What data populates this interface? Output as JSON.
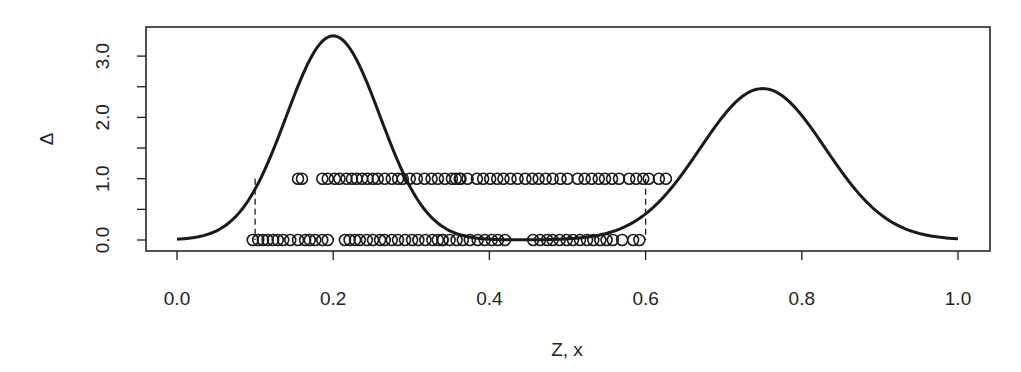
{
  "chart_data": {
    "type": "line",
    "title": "",
    "xlabel": "Z, x",
    "ylabel": "Δ",
    "xlim": [
      0.0,
      1.0
    ],
    "ylim": [
      0.0,
      3.0
    ],
    "x_ticks": [
      0.0,
      0.2,
      0.4,
      0.6,
      0.8,
      1.0
    ],
    "x_tick_labels": [
      "0.0",
      "0.2",
      "0.4",
      "0.6",
      "0.8",
      "1.0"
    ],
    "y_ticks": [
      0.0,
      0.5,
      1.0,
      1.5,
      2.0,
      2.5,
      3.0
    ],
    "y_tick_labels": [
      "0.0",
      "",
      "1.0",
      "",
      "2.0",
      "",
      "3.0"
    ],
    "grid": false,
    "legend": null,
    "series": [
      {
        "name": "curve",
        "kind": "line",
        "description": "bimodal curve: peak ~3.33 at x=0.2, peak ~2.47 at x=0.75",
        "components": [
          {
            "mean": 0.2,
            "sd": 0.06,
            "height": 3.33
          },
          {
            "mean": 0.75,
            "sd": 0.08,
            "height": 2.47
          }
        ],
        "x": [
          0.0,
          0.05,
          0.1,
          0.15,
          0.2,
          0.25,
          0.3,
          0.35,
          0.4,
          0.45,
          0.5,
          0.55,
          0.6,
          0.65,
          0.7,
          0.75,
          0.8,
          0.85,
          0.9,
          0.95,
          1.0
        ],
        "y": [
          0.013,
          0.146,
          0.83,
          2.35,
          3.33,
          2.35,
          0.83,
          0.15,
          0.013,
          0.0,
          0.017,
          0.11,
          0.43,
          1.14,
          2.03,
          2.47,
          2.03,
          1.14,
          0.43,
          0.11,
          0.02
        ]
      },
      {
        "name": "points_delta_1",
        "kind": "scatter",
        "marker": "open-circle",
        "y_value": 1.0,
        "x": [
          0.155,
          0.16,
          0.186,
          0.193,
          0.202,
          0.208,
          0.217,
          0.224,
          0.23,
          0.237,
          0.244,
          0.251,
          0.257,
          0.266,
          0.275,
          0.283,
          0.289,
          0.298,
          0.307,
          0.317,
          0.326,
          0.334,
          0.343,
          0.352,
          0.362,
          0.357,
          0.363,
          0.372,
          0.384,
          0.392,
          0.401,
          0.41,
          0.418,
          0.427,
          0.436,
          0.446,
          0.455,
          0.463,
          0.472,
          0.481,
          0.491,
          0.5,
          0.513,
          0.522,
          0.531,
          0.54,
          0.548,
          0.557,
          0.566,
          0.579,
          0.588,
          0.597,
          0.604,
          0.617,
          0.626
        ]
      },
      {
        "name": "points_delta_0",
        "kind": "scatter",
        "marker": "open-circle",
        "y_value": 0.0,
        "x": [
          0.097,
          0.104,
          0.11,
          0.116,
          0.123,
          0.129,
          0.136,
          0.145,
          0.155,
          0.164,
          0.17,
          0.177,
          0.186,
          0.193,
          0.215,
          0.221,
          0.228,
          0.234,
          0.243,
          0.251,
          0.26,
          0.266,
          0.275,
          0.283,
          0.292,
          0.301,
          0.309,
          0.318,
          0.327,
          0.334,
          0.34,
          0.34,
          0.349,
          0.358,
          0.366,
          0.375,
          0.385,
          0.394,
          0.403,
          0.411,
          0.42,
          0.456,
          0.465,
          0.474,
          0.481,
          0.49,
          0.499,
          0.507,
          0.516,
          0.525,
          0.533,
          0.542,
          0.55,
          0.558,
          0.57,
          0.584,
          0.592
        ]
      },
      {
        "name": "dashed_bounds",
        "kind": "vlines",
        "style": "dashed",
        "x": [
          0.1,
          0.6
        ],
        "y_from": 0.0,
        "y_to": 1.0
      }
    ]
  },
  "plot": {
    "box": {
      "left": 146,
      "top": 27,
      "right": 990,
      "bottom": 251
    },
    "x_px": {
      "zero": 177,
      "one": 958
    },
    "y_px": {
      "zero": 240,
      "per_unit": 61.3
    },
    "colors": {
      "ink": "#1a1a1a",
      "background": "#ffffff"
    }
  }
}
